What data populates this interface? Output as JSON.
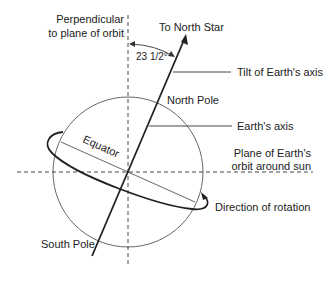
{
  "diagram": {
    "labels": {
      "perpendicular_line1": "Perpendicular",
      "perpendicular_line2": "to plane of orbit",
      "north_star": "To North Star",
      "angle": "23 1/2°",
      "tilt": "Tilt of Earth's axis",
      "north_pole": "North Pole",
      "earths_axis": "Earth's axis",
      "equator": "Equator",
      "plane_line1": "Plane of Earth's",
      "plane_line2": "orbit around sun",
      "rotation": "Direction of rotation",
      "south_pole": "South Pole"
    },
    "colors": {
      "line": "#222222",
      "thin_line": "#555555",
      "background": "#ffffff"
    }
  }
}
